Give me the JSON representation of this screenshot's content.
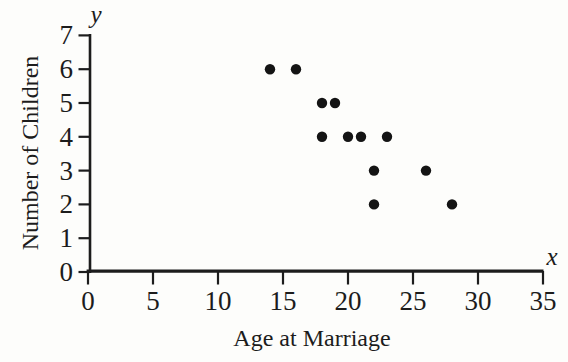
{
  "figure": {
    "background": "#fdfdfb",
    "ink": "#1c1c1c"
  },
  "chart_data": {
    "type": "scatter",
    "title": "",
    "xlabel": "Age at Marriage",
    "ylabel": "Number of Children",
    "x_axis_symbol": "x",
    "y_axis_symbol": "y",
    "xlim": [
      0,
      35
    ],
    "ylim": [
      0,
      7
    ],
    "x_ticks": [
      0,
      5,
      10,
      15,
      20,
      25,
      30,
      35
    ],
    "y_ticks": [
      0,
      1,
      2,
      3,
      4,
      5,
      6,
      7
    ],
    "grid": false,
    "legend": null,
    "point_color": "#141414",
    "point_radius": 5.2,
    "points": [
      {
        "x": 14,
        "y": 6
      },
      {
        "x": 16,
        "y": 6
      },
      {
        "x": 18,
        "y": 5
      },
      {
        "x": 19,
        "y": 5
      },
      {
        "x": 18,
        "y": 4
      },
      {
        "x": 20,
        "y": 4
      },
      {
        "x": 21,
        "y": 4
      },
      {
        "x": 23,
        "y": 4
      },
      {
        "x": 22,
        "y": 3
      },
      {
        "x": 26,
        "y": 3
      },
      {
        "x": 22,
        "y": 2
      },
      {
        "x": 28,
        "y": 2
      }
    ]
  }
}
